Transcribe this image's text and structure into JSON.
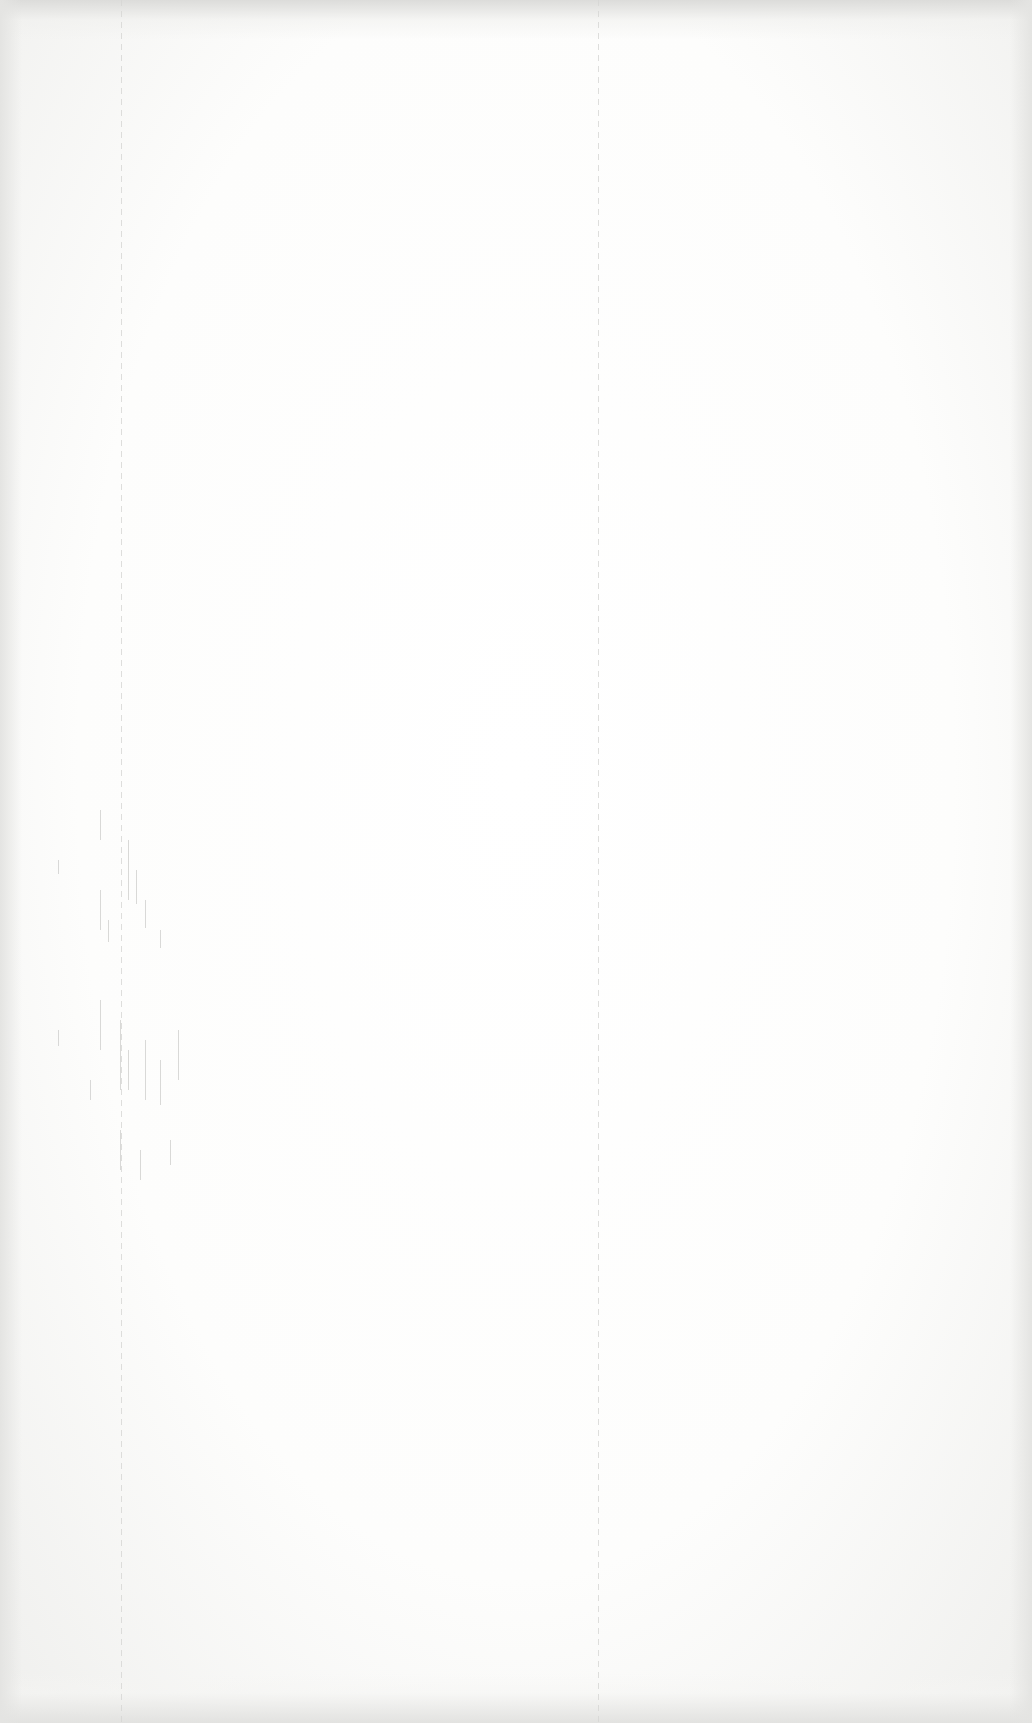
{
  "document": {
    "type": "blank-scanned-page",
    "text_content": [],
    "colors": {
      "paper": "#fbfbfa",
      "edge_shadow": "#dcdcda",
      "rule_line": "#d6d6d4",
      "bleed_marks": "#c9c9c7"
    },
    "layout": {
      "left_rule_x": 121,
      "center_divider_x": 598
    }
  }
}
